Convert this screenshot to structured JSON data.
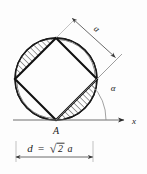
{
  "figure": {
    "labels": {
      "point_a": "A",
      "axis_x": "x",
      "angle_alpha": "α",
      "side_a": "a",
      "diagonal_expr_d": "d",
      "diagonal_expr_eq": "=",
      "diagonal_expr_radical": "√",
      "diagonal_expr_two": "2",
      "diagonal_expr_a": "a",
      "diagonal_full": "d = √2 a"
    },
    "colors": {
      "ink": "#1a1a1a",
      "thin_line": "#6f6f6f",
      "hatch": "#2b2b2b",
      "background": "#fdfdfd"
    },
    "geometry": {
      "circle_center_x": 56,
      "circle_center_y": 79,
      "circle_radius": 41,
      "square_rotation_deg": 45,
      "axis_y": 120,
      "axis_start_x": 13,
      "axis_end_x": 130,
      "dimension_line_y": 157,
      "dimension_start_x": 16,
      "dimension_end_x": 94,
      "angle_arc_radius": 44,
      "angle_value_deg": 45
    },
    "segments": [
      {
        "name": "upper-left-segment",
        "hatched": true
      },
      {
        "name": "upper-right-segment",
        "hatched": false
      },
      {
        "name": "lower-left-segment",
        "hatched": false
      },
      {
        "name": "lower-right-segment",
        "hatched": true
      }
    ]
  }
}
